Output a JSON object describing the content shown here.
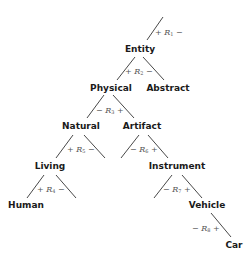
{
  "diagram": {
    "type": "tree",
    "note": "Relation subscripts are best-effort readings; the source pixels are too blurry to confirm every digit.",
    "nodes": {
      "entity": "Entity",
      "physical": "Physical",
      "abstract": "Abstract",
      "natural": "Natural",
      "artifact": "Artifact",
      "living": "Living",
      "instrument": "Instrument",
      "human": "Human",
      "vehicle": "Vehicle",
      "car": "Car"
    },
    "relations": [
      {
        "id": "r_top",
        "left": "+",
        "symbol": "R",
        "sub": "1",
        "right": "−"
      },
      {
        "id": "r_entity",
        "left": "+",
        "symbol": "R",
        "sub": "2",
        "right": "−"
      },
      {
        "id": "r_physical",
        "left": "−",
        "symbol": "R",
        "sub": "3",
        "right": "+"
      },
      {
        "id": "r_natural",
        "left": "+",
        "symbol": "R",
        "sub": "5",
        "right": "−"
      },
      {
        "id": "r_artifact",
        "left": "−",
        "symbol": "R",
        "sub": "6",
        "right": "+"
      },
      {
        "id": "r_living",
        "left": "+",
        "symbol": "R",
        "sub": "4",
        "right": "−"
      },
      {
        "id": "r_instrument",
        "left": "−",
        "symbol": "R",
        "sub": "7",
        "right": "+"
      },
      {
        "id": "r_vehicle",
        "left": "−",
        "symbol": "R",
        "sub": "8",
        "right": "+"
      }
    ],
    "colors": {
      "line": "#333333",
      "label": "#1a1a1a",
      "relation": "#555555",
      "background": "#ffffff"
    }
  }
}
